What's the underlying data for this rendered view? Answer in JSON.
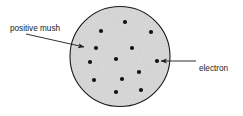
{
  "figure": {
    "background_color": "#ffffff",
    "sphere": {
      "name": "positive mush sphere",
      "center_x": 120,
      "center_y": 56.5,
      "radius": 50,
      "fill_color": "#d9d9d9",
      "stroke_color": "#1a1a1a",
      "stroke_width": 1.1,
      "texture": "speckled gray"
    },
    "electrons": {
      "name": "electron dots",
      "count": 13,
      "color": "#111111",
      "radius": 2.1,
      "positions": [
        {
          "x": 125,
          "y": 22
        },
        {
          "x": 101,
          "y": 31
        },
        {
          "x": 151,
          "y": 32
        },
        {
          "x": 96,
          "y": 48
        },
        {
          "x": 132,
          "y": 48
        },
        {
          "x": 116,
          "y": 59
        },
        {
          "x": 90,
          "y": 62
        },
        {
          "x": 157,
          "y": 61
        },
        {
          "x": 139,
          "y": 72
        },
        {
          "x": 94,
          "y": 80
        },
        {
          "x": 122,
          "y": 79
        },
        {
          "x": 141,
          "y": 90
        },
        {
          "x": 116,
          "y": 92
        }
      ]
    },
    "annotations": [
      {
        "id": "positive-mush",
        "label": "positive mush",
        "label_x": 10,
        "label_y": 31,
        "text_anchor": "start",
        "leader": {
          "x1": 26,
          "y1": 34,
          "x2": 84,
          "y2": 47,
          "arrow_at": "end"
        },
        "color": "#1a1a1a"
      },
      {
        "id": "electron",
        "label": "electron",
        "label_x": 199,
        "label_y": 71,
        "text_anchor": "start",
        "leader": {
          "x1": 196,
          "y1": 61,
          "x2": 161,
          "y2": 61,
          "arrow_at": "end"
        },
        "color": "#1a1a1a"
      }
    ]
  }
}
